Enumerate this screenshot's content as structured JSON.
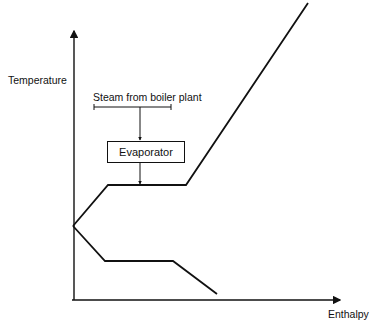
{
  "diagram": {
    "axes": {
      "y_label": "Temperature",
      "x_label": "Enthalpy"
    },
    "annotation": {
      "source_label": "Steam from boiler plant",
      "component_label": "Evaporator"
    },
    "curves": [
      {
        "name": "heating-curve",
        "points": [
          [
            73,
            226
          ],
          [
            108,
            185
          ],
          [
            186,
            185
          ],
          [
            308,
            3
          ]
        ]
      },
      {
        "name": "cooling-curve",
        "points": [
          [
            73,
            226
          ],
          [
            105,
            261
          ],
          [
            173,
            261
          ],
          [
            217,
            294
          ]
        ]
      }
    ],
    "colors": {
      "line": "#111111",
      "background": "#ffffff"
    }
  }
}
